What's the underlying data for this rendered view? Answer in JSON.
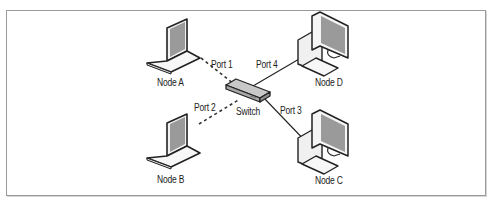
{
  "diagram": {
    "title": "",
    "nodes": [
      {
        "id": "node-a",
        "label": "Node A",
        "type": "laptop"
      },
      {
        "id": "node-b",
        "label": "Node B",
        "type": "laptop"
      },
      {
        "id": "node-c",
        "label": "Node C",
        "type": "desktop"
      },
      {
        "id": "node-d",
        "label": "Node D",
        "type": "desktop"
      },
      {
        "id": "switch",
        "label": "Switch",
        "type": "switch"
      }
    ],
    "ports": {
      "port1": "Port 1",
      "port2": "Port 2",
      "port3": "Port 3",
      "port4": "Port 4"
    },
    "links": [
      {
        "from": "Node A",
        "to": "Switch",
        "port": "Port 1",
        "style": "dashed"
      },
      {
        "from": "Node B",
        "to": "Switch",
        "port": "Port 2",
        "style": "dashed"
      },
      {
        "from": "Node C",
        "to": "Switch",
        "port": "Port 3",
        "style": "solid"
      },
      {
        "from": "Node D",
        "to": "Switch",
        "port": "Port 4",
        "style": "solid"
      }
    ],
    "colors": {
      "outline": "#222222",
      "screen": "#9a9a9a",
      "body": "#f4f4f4",
      "frame": "#9a9a9a"
    }
  }
}
